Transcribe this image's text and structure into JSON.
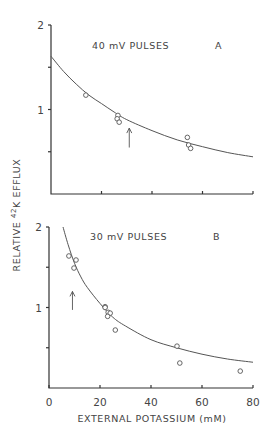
{
  "figure": {
    "ylabel": "RELATIVE 42K EFFLUX",
    "ylabel_parts": {
      "pre": "RELATIVE ",
      "sup": "42",
      "post": "K EFFLUX"
    },
    "xlabel": "EXTERNAL POTASSIUM (mM)"
  },
  "chart_data": [
    {
      "type": "scatter",
      "panel": "A",
      "title": "40 mV PULSES",
      "panel_label": "A",
      "xlabel": "",
      "ylabel": "RELATIVE 42K EFFLUX",
      "xlim": [
        0,
        80
      ],
      "ylim": [
        0,
        2
      ],
      "yticks": [
        {
          "v": 0.5,
          "label": ""
        },
        {
          "v": 1,
          "label": "1"
        },
        {
          "v": 1.5,
          "label": ""
        },
        {
          "v": 2,
          "label": "2"
        }
      ],
      "xticks": [
        {
          "v": 20,
          "label": ""
        },
        {
          "v": 40,
          "label": ""
        },
        {
          "v": 60,
          "label": ""
        },
        {
          "v": 80,
          "label": ""
        }
      ],
      "points": [
        {
          "x": 13.8,
          "y": 1.17
        },
        {
          "x": 26.5,
          "y": 0.93
        },
        {
          "x": 26.2,
          "y": 0.89
        },
        {
          "x": 27.0,
          "y": 0.85
        },
        {
          "x": 54.0,
          "y": 0.67
        },
        {
          "x": 54.5,
          "y": 0.58
        },
        {
          "x": 55.3,
          "y": 0.54
        }
      ],
      "fit_curve": [
        {
          "x": 0,
          "y": 1.63
        },
        {
          "x": 5,
          "y": 1.45
        },
        {
          "x": 10,
          "y": 1.3
        },
        {
          "x": 15,
          "y": 1.17
        },
        {
          "x": 20,
          "y": 1.07
        },
        {
          "x": 25,
          "y": 0.97
        },
        {
          "x": 30,
          "y": 0.88
        },
        {
          "x": 40,
          "y": 0.75
        },
        {
          "x": 50,
          "y": 0.64
        },
        {
          "x": 60,
          "y": 0.56
        },
        {
          "x": 70,
          "y": 0.49
        },
        {
          "x": 80,
          "y": 0.44
        }
      ],
      "arrow": {
        "x": 31,
        "y_from": 0.55,
        "y_to": 0.78
      }
    },
    {
      "type": "scatter",
      "panel": "B",
      "title": "30 mV PULSES",
      "panel_label": "B",
      "xlabel": "EXTERNAL POTASSIUM (mM)",
      "ylabel": "RELATIVE 42K EFFLUX",
      "xlim": [
        0,
        80
      ],
      "ylim": [
        0,
        2
      ],
      "yticks": [
        {
          "v": 0.5,
          "label": ""
        },
        {
          "v": 1,
          "label": "1"
        },
        {
          "v": 1.5,
          "label": ""
        },
        {
          "v": 2,
          "label": "2"
        }
      ],
      "xticks": [
        {
          "v": 0,
          "label": "0"
        },
        {
          "v": 20,
          "label": "20"
        },
        {
          "v": 40,
          "label": "40"
        },
        {
          "v": 60,
          "label": "60"
        },
        {
          "v": 80,
          "label": "80"
        }
      ],
      "points": [
        {
          "x": 7.8,
          "y": 1.64
        },
        {
          "x": 10.6,
          "y": 1.59
        },
        {
          "x": 9.8,
          "y": 1.49
        },
        {
          "x": 22.0,
          "y": 1.01
        },
        {
          "x": 22.0,
          "y": 1.0
        },
        {
          "x": 23.2,
          "y": 0.94
        },
        {
          "x": 24.0,
          "y": 0.93
        },
        {
          "x": 23.0,
          "y": 0.89
        },
        {
          "x": 26.0,
          "y": 0.72
        },
        {
          "x": 50.2,
          "y": 0.52
        },
        {
          "x": 51.3,
          "y": 0.31
        },
        {
          "x": 75.0,
          "y": 0.21
        }
      ],
      "fit_curve": [
        {
          "x": 5.5,
          "y": 2.0
        },
        {
          "x": 7.5,
          "y": 1.78
        },
        {
          "x": 10,
          "y": 1.55
        },
        {
          "x": 12.5,
          "y": 1.38
        },
        {
          "x": 15,
          "y": 1.25
        },
        {
          "x": 20,
          "y": 1.05
        },
        {
          "x": 25,
          "y": 0.88
        },
        {
          "x": 30,
          "y": 0.77
        },
        {
          "x": 40,
          "y": 0.6
        },
        {
          "x": 50,
          "y": 0.5
        },
        {
          "x": 60,
          "y": 0.42
        },
        {
          "x": 70,
          "y": 0.36
        },
        {
          "x": 80,
          "y": 0.32
        }
      ],
      "arrow": {
        "x": 9.2,
        "y_from": 0.97,
        "y_to": 1.2
      }
    }
  ]
}
